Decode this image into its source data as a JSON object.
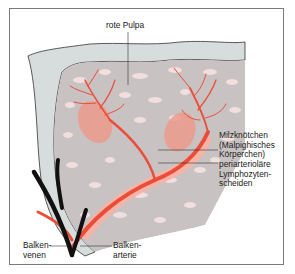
{
  "figure": {
    "colors": {
      "capsule": "#d7dcdc",
      "red_pulp_background": "#c9c2c2",
      "red_pulp_islands": "#f1dede",
      "artery": "#ea4d3a",
      "sheath": "#f6b4a6",
      "follicle": "#ec9b8c",
      "veins": "#111111",
      "label_text": "#222222",
      "leader_line": "#333333"
    }
  },
  "labels": {
    "rote_pulpa": "rote Pulpa",
    "milzknoetchen": "Milzknötchen\n(Malpighisches\nKörperchen)",
    "periarterioläre": "periarterioläre\nLymphozyten-\nscheiden",
    "balkenvenen": "Balken-\nvenen",
    "balkenarterie": "Balken-\narterie"
  }
}
